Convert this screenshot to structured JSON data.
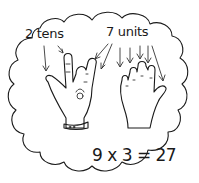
{
  "illustration": {
    "labels": {
      "tens": "2 tens",
      "units": "7 units",
      "equation": "9 x 3 = 27"
    },
    "colors": {
      "ink": "#1a1a1a",
      "background": "#ffffff"
    },
    "icons": [
      "thought-cloud-outline",
      "left-hand-icon",
      "right-hand-icon",
      "arrow-icon"
    ]
  }
}
